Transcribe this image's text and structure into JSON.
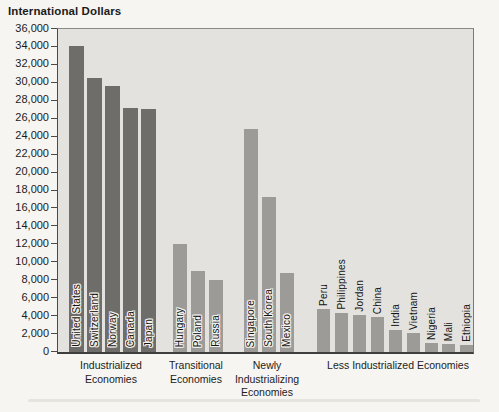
{
  "title": "International Dollars",
  "colors": {
    "page_bg": "#f6f5f2",
    "plot_bg": "#e3e2df",
    "bar_industrialized": "#6f6d6a",
    "bar_other": "#9d9b97",
    "axis_line": "#4a4a48",
    "text": "#1b1b1b"
  },
  "y_axis": {
    "min": 0,
    "max": 36000,
    "step": 2000,
    "tick_labels": [
      "36,000",
      "34,000",
      "32,000",
      "30,000",
      "28,000",
      "26,000",
      "24,000",
      "22,000",
      "20,000",
      "18,000",
      "16,000",
      "14,000",
      "12,000",
      "10,000",
      "8,000",
      "6,000",
      "4,000",
      "2,000",
      "0"
    ]
  },
  "chart_data": {
    "type": "bar",
    "title": "International Dollars",
    "ylabel": "International Dollars",
    "ylim": [
      0,
      36000
    ],
    "ytick_step": 2000,
    "grid": false,
    "legend": "none",
    "groups": [
      {
        "label": "Industrialized\nEconomies",
        "bar_color": "#6f6d6a",
        "label_pos": "inside",
        "center_x": 111,
        "bar_width": 15,
        "bars": [
          {
            "country": "United States",
            "value": 34100,
            "x": 11
          },
          {
            "country": "Switzerland",
            "value": 30500,
            "x": 29
          },
          {
            "country": "Norway",
            "value": 29600,
            "x": 47
          },
          {
            "country": "Canada",
            "value": 27200,
            "x": 65
          },
          {
            "country": "Japan",
            "value": 27100,
            "x": 83
          }
        ]
      },
      {
        "label": "Transitional\nEconomies",
        "bar_color": "#9d9b97",
        "label_pos": "inside",
        "center_x": 196,
        "bar_width": 14,
        "bars": [
          {
            "country": "Hungary",
            "value": 12000,
            "x": 115
          },
          {
            "country": "Poland",
            "value": 9000,
            "x": 133
          },
          {
            "country": "Russia",
            "value": 8000,
            "x": 151
          }
        ]
      },
      {
        "label": "Newly\nIndustrializing\nEconomies",
        "bar_color": "#9d9b97",
        "label_pos": "inside",
        "center_x": 267,
        "bar_width": 14,
        "bars": [
          {
            "country": "Singapore",
            "value": 24900,
            "x": 186
          },
          {
            "country": "South Korea",
            "value": 17300,
            "x": 204
          },
          {
            "country": "Mexico",
            "value": 8800,
            "x": 222
          }
        ]
      },
      {
        "label": "Less Industrialized Economies",
        "bar_color": "#9d9b97",
        "label_pos": "above",
        "center_x": 398,
        "bar_width": 13,
        "bars": [
          {
            "country": "Peru",
            "value": 4800,
            "x": 259
          },
          {
            "country": "Philippines",
            "value": 4300,
            "x": 277
          },
          {
            "country": "Jordan",
            "value": 4100,
            "x": 295
          },
          {
            "country": "China",
            "value": 3900,
            "x": 313
          },
          {
            "country": "India",
            "value": 2500,
            "x": 331
          },
          {
            "country": "Vietnam",
            "value": 2100,
            "x": 349
          },
          {
            "country": "Nigeria",
            "value": 1000,
            "x": 367
          },
          {
            "country": "Mali",
            "value": 900,
            "x": 384
          },
          {
            "country": "Ethiopia",
            "value": 800,
            "x": 402
          }
        ]
      }
    ]
  }
}
